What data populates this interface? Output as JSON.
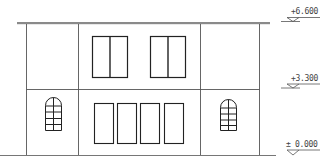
{
  "drawing": {
    "type": "building-elevation",
    "stroke_color": "#333333",
    "roof_color": "#8a8a8a",
    "levels": [
      {
        "label": "+6.600",
        "y": 19
      },
      {
        "label": "+3.300",
        "y": 85
      },
      {
        "label": "± 0.000",
        "y": 151
      }
    ]
  }
}
